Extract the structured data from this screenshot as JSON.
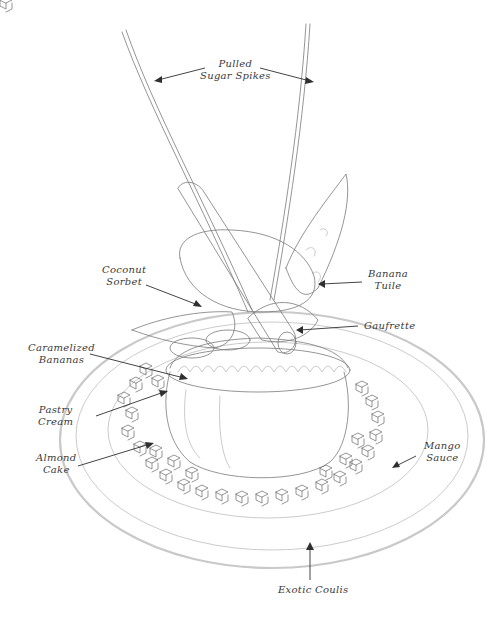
{
  "diagram": {
    "labels": {
      "pulled_sugar_spikes": [
        "Pulled",
        "Sugar Spikes"
      ],
      "coconut_sorbet": [
        "Coconut",
        "Sorbet"
      ],
      "banana_tuile": [
        "Banana",
        "Tuile"
      ],
      "gaufrette": [
        "Gaufrette"
      ],
      "caramelized_bananas": [
        "Caramelized",
        "Bananas"
      ],
      "pastry_cream": [
        "Pastry",
        "Cream"
      ],
      "almond_cake": [
        "Almond",
        "Cake"
      ],
      "mango_sauce": [
        "Mango",
        "Sauce"
      ],
      "exotic_coulis": [
        "Exotic Coulis"
      ]
    }
  }
}
